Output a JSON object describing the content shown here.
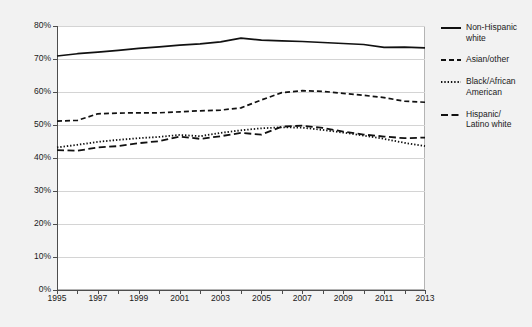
{
  "chart_data": {
    "type": "line",
    "title": "",
    "subtitle": "",
    "xlabel": "",
    "ylabel": "",
    "xlim": [
      1995,
      2013
    ],
    "ylim": [
      0,
      80
    ],
    "y_tick_labels": [
      "0%",
      "10%",
      "20%",
      "30%",
      "40%",
      "50%",
      "60%",
      "70%",
      "80%"
    ],
    "y_tick_values": [
      0,
      10,
      20,
      30,
      40,
      50,
      60,
      70,
      80
    ],
    "x_tick_labels": [
      "1995",
      "1997",
      "1999",
      "2001",
      "2003",
      "2005",
      "2007",
      "2009",
      "2011",
      "2013"
    ],
    "x_tick_values": [
      1995,
      1997,
      1999,
      2001,
      2003,
      2005,
      2007,
      2009,
      2011,
      2013
    ],
    "x_minor_ticks": [
      1996,
      1998,
      2000,
      2002,
      2004,
      2006,
      2008,
      2010,
      2012
    ],
    "grid": true,
    "grid_axis": "y",
    "legend_position": "right",
    "x": [
      1995,
      1996,
      1997,
      1998,
      1999,
      2000,
      2001,
      2002,
      2003,
      2004,
      2005,
      2006,
      2007,
      2008,
      2009,
      2010,
      2011,
      2012,
      2013
    ],
    "series": [
      {
        "name": "Non-Hispanic white",
        "style": "solid",
        "color": "#111111",
        "values": [
          70.9,
          71.6,
          72.1,
          72.6,
          73.2,
          73.7,
          74.2,
          74.6,
          75.2,
          76.3,
          75.7,
          75.5,
          75.3,
          75.0,
          74.7,
          74.4,
          73.5,
          73.6,
          73.4
        ]
      },
      {
        "name": "Asian/other",
        "style": "dashed",
        "color": "#111111",
        "values": [
          51.2,
          51.4,
          53.4,
          53.6,
          53.7,
          53.7,
          54.0,
          54.3,
          54.5,
          55.2,
          57.6,
          59.8,
          60.4,
          60.2,
          59.6,
          59.0,
          58.3,
          57.2,
          56.9
        ]
      },
      {
        "name": "Black/African American",
        "style": "dotted",
        "color": "#111111",
        "values": [
          43.2,
          44.0,
          44.9,
          45.5,
          46.0,
          46.4,
          47.0,
          46.6,
          47.6,
          48.4,
          49.0,
          49.3,
          49.2,
          48.5,
          47.7,
          46.8,
          45.8,
          44.6,
          43.6
        ]
      },
      {
        "name": "Hispanic/Latino white",
        "style": "dashdot",
        "color": "#111111",
        "values": [
          42.4,
          42.2,
          43.2,
          43.6,
          44.5,
          45.1,
          46.5,
          45.8,
          46.6,
          47.6,
          47.1,
          49.5,
          49.8,
          49.1,
          48.0,
          47.1,
          46.5,
          46.0,
          46.2
        ]
      }
    ]
  },
  "legend": {
    "items": [
      {
        "label": "Non-Hispanic\nwhite",
        "style": "solid"
      },
      {
        "label": "Asian/other",
        "style": "dashed"
      },
      {
        "label": "Black/African\nAmerican",
        "style": "dotted"
      },
      {
        "label": "Hispanic/\nLatino white",
        "style": "dashdot"
      }
    ]
  },
  "colors": {
    "line": "#111111",
    "grid": "#d4d4d4",
    "axis": "#4d4d4d",
    "plot_background": "#ffffff",
    "figure_background": "#f2f2f2",
    "text": "#1a1a1a"
  }
}
